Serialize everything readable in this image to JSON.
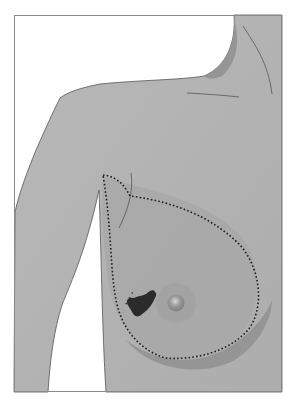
{
  "figure": {
    "colors": {
      "background": "#ffffff",
      "frame": "#8a8a8a",
      "skin": "#b3b3b3",
      "breast_tissue": "#a9a9a9",
      "shadow": "#9a9a9a",
      "outline": "#555555",
      "dotted_line": "#1e1e1e",
      "areola": "#a5a5a5",
      "nipple": "#8e8e8e",
      "lesion": "#2b2b2b"
    },
    "regions": [
      {
        "name": "neck-shoulder",
        "label": ""
      },
      {
        "name": "arm",
        "label": ""
      },
      {
        "name": "breast",
        "label": ""
      },
      {
        "name": "breast-tissue-boundary",
        "label": ""
      },
      {
        "name": "areola-nipple",
        "label": ""
      },
      {
        "name": "lesion",
        "label": ""
      }
    ]
  }
}
